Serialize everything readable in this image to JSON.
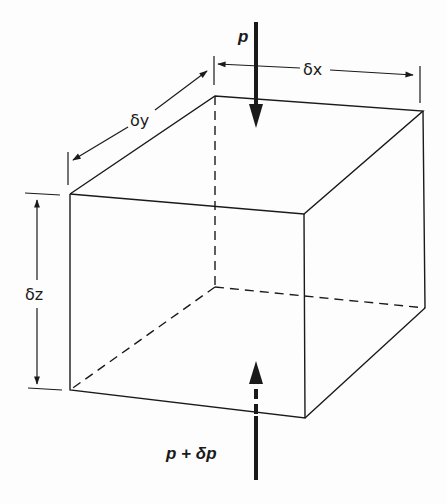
{
  "diagram": {
    "type": "fluid-element-cube",
    "labels": {
      "top_pressure": "p",
      "bottom_pressure": "p + δp",
      "dim_x": "δx",
      "dim_y": "δy",
      "dim_z": "δz"
    },
    "colors": {
      "line": "#1a1a1a",
      "background": "#fdfdfd"
    },
    "elements": [
      {
        "id": "cube",
        "kind": "rectangular box, hidden edges dashed"
      },
      {
        "id": "arrow-top",
        "kind": "thick arrow pointing down onto top face",
        "label": "p"
      },
      {
        "id": "arrow-bottom",
        "kind": "thick arrow pointing up through bottom face (dashed inside)",
        "label": "p + δp"
      },
      {
        "id": "dim-x",
        "kind": "double-headed dimension arrow along back-top edge",
        "label": "δx"
      },
      {
        "id": "dim-y",
        "kind": "double-headed dimension arrow along left-top edge",
        "label": "δy"
      },
      {
        "id": "dim-z",
        "kind": "double-headed dimension arrow along front-left vertical edge",
        "label": "δz"
      }
    ]
  }
}
